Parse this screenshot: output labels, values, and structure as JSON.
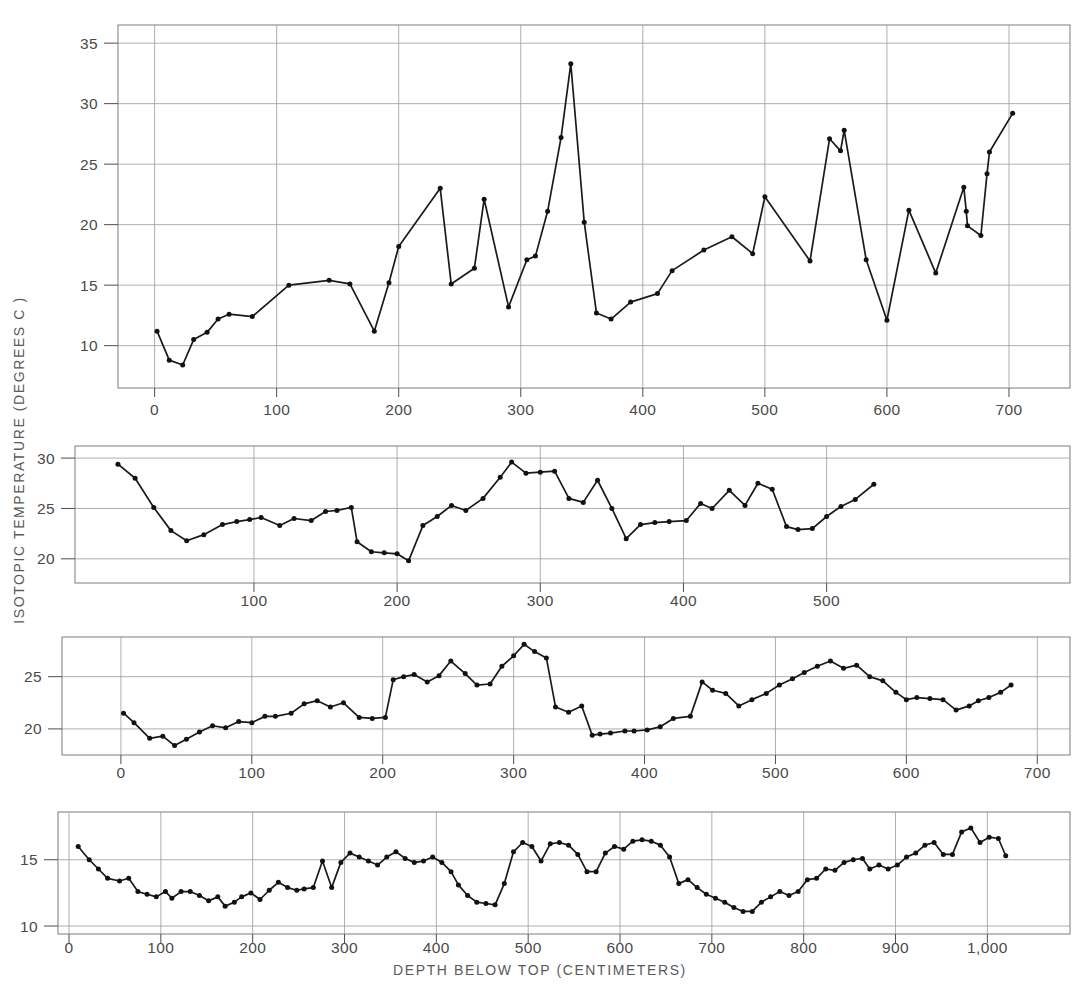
{
  "figure": {
    "y_axis_label": "ISOTOPIC TEMPERATURE (DEGREES C )",
    "x_axis_label": "DEPTH BELOW TOP (CENTIMETERS)",
    "background_color": "#ffffff",
    "line_color": "#1a1a1a",
    "grid_color": "#9a9a9a",
    "text_color": "#4a4a4a"
  },
  "chart_data": [
    {
      "type": "line",
      "panel": "panel-1",
      "title": "",
      "xlabel": "",
      "ylabel": "ISOTOPIC TEMPERATURE (DEGREES C )",
      "xlim": [
        -30,
        750
      ],
      "ylim": [
        6.5,
        36.5
      ],
      "xticks": [
        0,
        100,
        200,
        300,
        400,
        500,
        600,
        700
      ],
      "yticks": [
        10,
        15,
        20,
        25,
        30,
        35
      ],
      "grid": true,
      "legend": "none",
      "x": [
        2,
        12,
        23,
        32,
        43,
        52,
        61,
        80,
        110,
        143,
        160,
        180,
        192,
        200,
        234,
        243,
        262,
        270,
        290,
        305,
        312,
        322,
        333,
        341,
        352,
        362,
        374,
        390,
        412,
        424,
        450,
        473,
        490,
        500,
        537,
        553,
        562,
        565,
        583,
        600,
        618,
        640,
        663,
        665,
        666,
        677,
        682,
        684,
        703
      ],
      "y": [
        11.2,
        8.8,
        8.4,
        10.5,
        11.1,
        12.2,
        12.6,
        12.4,
        15.0,
        15.4,
        15.1,
        11.2,
        15.2,
        18.2,
        23.0,
        15.1,
        16.4,
        22.1,
        13.2,
        17.1,
        17.4,
        21.1,
        27.2,
        33.3,
        20.2,
        12.7,
        12.2,
        13.6,
        14.3,
        16.2,
        17.9,
        19.0,
        17.6,
        22.3,
        17.0,
        27.1,
        26.1,
        27.8,
        17.1,
        12.1,
        21.2,
        16.0,
        23.1,
        21.1,
        19.9,
        19.1,
        24.2,
        26.0,
        29.2
      ]
    },
    {
      "type": "line",
      "panel": "panel-2",
      "title": "",
      "xlabel": "",
      "ylabel": "",
      "xlim": [
        -25,
        670
      ],
      "ylim": [
        17.6,
        31.2
      ],
      "xticks": [
        100,
        200,
        300,
        400,
        500
      ],
      "yticks": [
        20,
        25,
        30
      ],
      "grid": true,
      "legend": "none",
      "x": [
        5,
        17,
        30,
        42,
        53,
        65,
        78,
        88,
        97,
        105,
        118,
        128,
        140,
        150,
        158,
        168,
        172,
        182,
        191,
        200,
        208,
        218,
        228,
        238,
        248,
        260,
        272,
        280,
        290,
        300,
        310,
        320,
        330,
        340,
        350,
        360,
        370,
        380,
        390,
        402,
        412,
        420,
        432,
        443,
        452,
        462,
        472,
        480,
        490,
        500,
        510,
        520,
        533
      ],
      "y": [
        29.4,
        28.0,
        25.1,
        22.8,
        21.8,
        22.4,
        23.4,
        23.7,
        23.9,
        24.1,
        23.3,
        24.0,
        23.8,
        24.7,
        24.8,
        25.1,
        21.7,
        20.7,
        20.6,
        20.5,
        19.8,
        23.3,
        24.2,
        25.3,
        24.8,
        26.0,
        28.1,
        29.6,
        28.5,
        28.6,
        28.7,
        26.0,
        25.6,
        27.8,
        25.0,
        22.0,
        23.4,
        23.6,
        23.7,
        23.8,
        25.5,
        25.0,
        26.8,
        25.3,
        27.5,
        26.9,
        23.2,
        22.9,
        23.0,
        24.2,
        25.2,
        25.9,
        27.4
      ]
    },
    {
      "type": "line",
      "panel": "panel-3",
      "title": "",
      "xlabel": "",
      "ylabel": "",
      "xlim": [
        -45,
        725
      ],
      "ylim": [
        17.5,
        28.8
      ],
      "xticks": [
        0,
        100,
        200,
        300,
        400,
        500,
        600,
        700
      ],
      "yticks": [
        20,
        25
      ],
      "grid": true,
      "legend": "none",
      "x": [
        2,
        10,
        22,
        32,
        41,
        50,
        60,
        70,
        80,
        90,
        100,
        110,
        118,
        130,
        140,
        150,
        160,
        170,
        182,
        192,
        202,
        208,
        216,
        224,
        234,
        243,
        252,
        263,
        272,
        282,
        291,
        300,
        308,
        316,
        325,
        332,
        342,
        352,
        360,
        366,
        374,
        385,
        392,
        402,
        412,
        422,
        435,
        444,
        452,
        462,
        472,
        482,
        493,
        503,
        513,
        522,
        532,
        542,
        552,
        562,
        572,
        582,
        592,
        600,
        608,
        618,
        628,
        638,
        648,
        655,
        663,
        672,
        680
      ],
      "y": [
        21.5,
        20.6,
        19.1,
        19.3,
        18.4,
        19.0,
        19.7,
        20.3,
        20.1,
        20.7,
        20.6,
        21.2,
        21.2,
        21.5,
        22.4,
        22.7,
        22.1,
        22.5,
        21.1,
        21.0,
        21.1,
        24.7,
        25.0,
        25.2,
        24.5,
        25.1,
        26.5,
        25.3,
        24.2,
        24.3,
        26.0,
        27.0,
        28.1,
        27.4,
        26.8,
        22.1,
        21.6,
        22.2,
        19.4,
        19.5,
        19.6,
        19.8,
        19.8,
        19.9,
        20.2,
        21.0,
        21.2,
        24.5,
        23.7,
        23.4,
        22.2,
        22.8,
        23.4,
        24.2,
        24.8,
        25.4,
        26.0,
        26.5,
        25.8,
        26.1,
        25.0,
        24.6,
        23.5,
        22.8,
        23.0,
        22.9,
        22.8,
        21.8,
        22.2,
        22.7,
        23.0,
        23.5,
        24.2
      ]
    },
    {
      "type": "line",
      "panel": "panel-4",
      "title": "",
      "xlabel": "DEPTH BELOW TOP (CENTIMETERS)",
      "ylabel": "",
      "xlim": [
        -12,
        1090
      ],
      "ylim": [
        9.4,
        18.6
      ],
      "xticks": [
        0,
        100,
        200,
        300,
        400,
        500,
        600,
        700,
        800,
        900,
        1000
      ],
      "xticklabels": [
        "0",
        "100",
        "200",
        "300",
        "400",
        "500",
        "600",
        "700",
        "800",
        "900",
        "1,000"
      ],
      "yticks": [
        10,
        15
      ],
      "grid": true,
      "legend": "none",
      "x": [
        10,
        22,
        32,
        42,
        55,
        65,
        75,
        85,
        95,
        105,
        112,
        122,
        132,
        142,
        152,
        162,
        170,
        180,
        188,
        198,
        208,
        218,
        228,
        238,
        248,
        256,
        266,
        276,
        286,
        296,
        306,
        316,
        326,
        336,
        346,
        356,
        366,
        376,
        386,
        396,
        406,
        416,
        424,
        434,
        444,
        454,
        464,
        474,
        484,
        494,
        504,
        514,
        524,
        534,
        544,
        554,
        564,
        574,
        584,
        594,
        604,
        614,
        624,
        634,
        644,
        654,
        664,
        674,
        684,
        694,
        704,
        714,
        724,
        734,
        744,
        754,
        764,
        774,
        784,
        794,
        804,
        814,
        824,
        834,
        844,
        854,
        864,
        872,
        882,
        892,
        902,
        912,
        922,
        932,
        942,
        952,
        962,
        972,
        982,
        992,
        1002,
        1012,
        1020
      ],
      "y": [
        16.0,
        15.0,
        14.3,
        13.6,
        13.4,
        13.6,
        12.6,
        12.4,
        12.2,
        12.6,
        12.1,
        12.6,
        12.6,
        12.3,
        11.9,
        12.2,
        11.5,
        11.8,
        12.2,
        12.5,
        12.0,
        12.7,
        13.3,
        12.9,
        12.7,
        12.8,
        12.9,
        14.9,
        12.9,
        14.8,
        15.5,
        15.2,
        14.9,
        14.6,
        15.2,
        15.6,
        15.1,
        14.8,
        14.9,
        15.2,
        14.8,
        14.1,
        13.1,
        12.3,
        11.8,
        11.7,
        11.6,
        13.2,
        15.6,
        16.3,
        16.0,
        14.9,
        16.2,
        16.3,
        16.1,
        15.4,
        14.1,
        14.1,
        15.5,
        16.0,
        15.8,
        16.4,
        16.5,
        16.4,
        16.1,
        15.2,
        13.2,
        13.5,
        12.9,
        12.4,
        12.1,
        11.8,
        11.4,
        11.1,
        11.1,
        11.8,
        12.2,
        12.6,
        12.3,
        12.6,
        13.5,
        13.6,
        14.3,
        14.2,
        14.8,
        15.0,
        15.1,
        14.3,
        14.6,
        14.3,
        14.6,
        15.2,
        15.5,
        16.1,
        16.3,
        15.4,
        15.4,
        17.1,
        17.4,
        16.3,
        16.7,
        16.6,
        15.3,
        15.0,
        16.0
      ]
    }
  ]
}
